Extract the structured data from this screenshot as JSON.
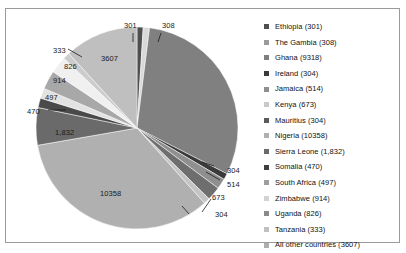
{
  "chart_data": {
    "type": "pie",
    "title": "",
    "legend_position": "right",
    "grid": false,
    "total": 28384,
    "categories": [
      "Ethiopia",
      "The Gambia",
      "Ghana",
      "Ireland",
      "Jamaica",
      "Kenya",
      "Mauritius",
      "Nigeria",
      "Sierra Leone",
      "Somalia",
      "South Africa",
      "Zimbabwe",
      "Uganda",
      "Tanzania",
      "All other countries"
    ],
    "values": [
      301,
      308,
      9318,
      304,
      514,
      673,
      304,
      10358,
      1832,
      470,
      497,
      914,
      826,
      333,
      3607
    ],
    "data_labels": [
      "301",
      "308",
      "9318",
      "304",
      "514",
      "673",
      "304",
      "10358",
      "1,832",
      "470",
      "497",
      "914",
      "826",
      "333",
      "3607"
    ],
    "colors": [
      "#4f4f4f",
      "#d9d9d9",
      "#808080",
      "#3a3a3a",
      "#8f8f8f",
      "#6e6e6e",
      "#c4c4c4",
      "#b0b0b0",
      "#6a6a6a",
      "#4a4a4a",
      "#e2e2e2",
      "#a8a8a8",
      "#f0f0f0",
      "#cccccc",
      "#bfbfbf"
    ]
  },
  "legend": {
    "items": [
      {
        "label": "Ethiopia (301)",
        "color": "#4f4f4f"
      },
      {
        "label": "The Gambia (308)",
        "color": "#9a9a9a"
      },
      {
        "label": "Ghana (9318)",
        "color": "#808080"
      },
      {
        "label": "Ireland (304)",
        "color": "#3a3a3a"
      },
      {
        "label": "Jamaica (514)",
        "color": "#8f8f8f"
      },
      {
        "label": "Kenya (673)",
        "color": "#c9c9c9"
      },
      {
        "label": "Mauritius (304)",
        "color": "#5a5a5a"
      },
      {
        "label": "Nigeria (10358)",
        "color": "#b0b0b0"
      },
      {
        "label": "Sierra Leone (1,832)",
        "color": "#6a6a6a"
      },
      {
        "label": "Somalia (470)",
        "color": "#3f3f3f"
      },
      {
        "label": "South Africa (497)",
        "color": "#9e9e9e"
      },
      {
        "label": "Zimbabwe (914)",
        "color": "#d2d2d2"
      },
      {
        "label": "Uganda (826)",
        "color": "#8a8a8a"
      },
      {
        "label": "Tanzania (333)",
        "color": "#c0c0c0"
      },
      {
        "label": "All other countries (3607)",
        "color": "#adadad"
      }
    ]
  },
  "pie_labels": [
    {
      "text": "301",
      "x": 118,
      "y": 13
    },
    {
      "text": "308",
      "x": 156,
      "y": 13
    },
    {
      "text": "3607",
      "x": 95,
      "y": 46
    },
    {
      "text": "333",
      "x": 47,
      "y": 38
    },
    {
      "text": "826",
      "x": 58,
      "y": 54
    },
    {
      "text": "914",
      "x": 47,
      "y": 68
    },
    {
      "text": "497",
      "x": 39,
      "y": 85
    },
    {
      "text": "470",
      "x": 21,
      "y": 99
    },
    {
      "text": "1,832",
      "x": 49,
      "y": 120
    },
    {
      "text": "10358",
      "x": 94,
      "y": 181
    },
    {
      "text": "304",
      "x": 209,
      "y": 202
    },
    {
      "text": "673",
      "x": 206,
      "y": 185
    },
    {
      "text": "514",
      "x": 221,
      "y": 172
    },
    {
      "text": "304",
      "x": 221,
      "y": 158
    }
  ]
}
